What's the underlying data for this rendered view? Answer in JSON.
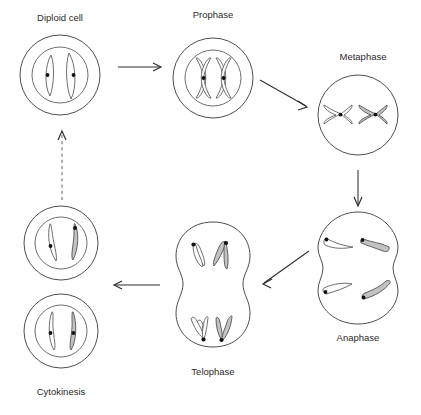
{
  "diagram": {
    "background_color": "#ffffff",
    "line_color": "#3a3a3a",
    "chromosome_shaded_color": "#c2c2c2",
    "chromosome_light_color": "#fdfdfd",
    "centromere_color": "#111111",
    "stages": [
      {
        "id": "diploid-cell",
        "label": "Diploid cell",
        "label_position": "above",
        "cell_shape": "circle-with-nucleus",
        "chromosome_count": 2,
        "chromosome_shape": "long-thin-curved",
        "shading": [
          "light",
          "light"
        ],
        "centromeres": 2
      },
      {
        "id": "prophase",
        "label": "Prophase",
        "label_position": "above",
        "cell_shape": "circle-with-nucleus",
        "chromosome_count": 2,
        "chromosome_shape": "x-shaped-condensed",
        "shading": [
          "light",
          "light"
        ],
        "centromeres": 2
      },
      {
        "id": "metaphase",
        "label": "Metaphase",
        "label_position": "above",
        "cell_shape": "circle",
        "chromosome_count": 2,
        "chromosome_shape": "x-shaped-horizontal-equator",
        "shading": [
          "light",
          "shaded"
        ],
        "centromeres": 2
      },
      {
        "id": "anaphase",
        "label": "Anaphase",
        "label_position": "below",
        "cell_shape": "pinched-circle",
        "chromosome_count": 4,
        "chromosome_shape": "v-shaped-chromatid",
        "shading": [
          "light",
          "shaded",
          "light",
          "shaded"
        ],
        "centromeres": 4
      },
      {
        "id": "telophase",
        "label": "Telophase",
        "label_position": "below",
        "cell_shape": "vertical-dumbbell",
        "chromosome_count": 4,
        "chromosome_shape": "v-shaped-chromatid",
        "shading": [
          "light",
          "shaded",
          "light",
          "shaded"
        ],
        "centromeres": 4
      },
      {
        "id": "cytokinesis",
        "label": "Cytokinesis",
        "label_position": "below",
        "cell_shape": "two-separate-circles-with-nuclei",
        "daughter_cells": 2,
        "chromosome_count": 4,
        "chromosome_shape": "long-thin-curved",
        "shading": [
          "light",
          "shaded",
          "light",
          "shaded"
        ],
        "centromeres": 4
      }
    ],
    "arrows": [
      {
        "id": "arrow-diploid-to-prophase",
        "from": "diploid-cell",
        "to": "prophase",
        "direction": "right",
        "style": "solid"
      },
      {
        "id": "arrow-prophase-to-metaphase",
        "from": "prophase",
        "to": "metaphase",
        "direction": "down-right",
        "style": "solid"
      },
      {
        "id": "arrow-metaphase-to-anaphase",
        "from": "metaphase",
        "to": "anaphase",
        "direction": "down",
        "style": "solid"
      },
      {
        "id": "arrow-anaphase-to-telophase",
        "from": "anaphase",
        "to": "telophase",
        "direction": "up-left",
        "style": "solid"
      },
      {
        "id": "arrow-telophase-to-cytokinesis",
        "from": "telophase",
        "to": "cytokinesis",
        "direction": "left",
        "style": "solid"
      },
      {
        "id": "arrow-cytokinesis-to-diploid",
        "from": "cytokinesis",
        "to": "diploid-cell",
        "direction": "up",
        "style": "dashed"
      }
    ]
  }
}
